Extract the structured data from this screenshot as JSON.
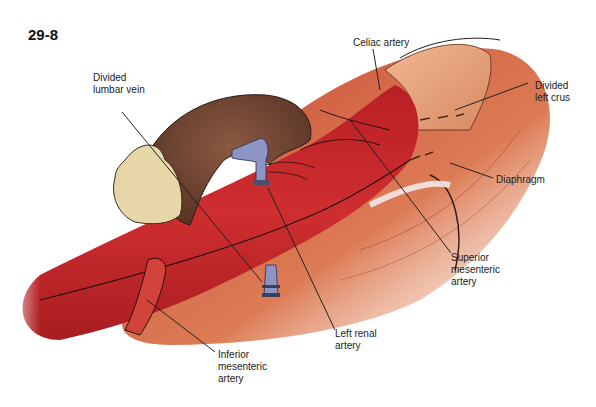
{
  "figure": {
    "number": "29-8"
  },
  "labels": {
    "celiac_artery": "Celiac artery",
    "divided_left_crus": "Divided\nleft crus",
    "divided_lumbar_vein": "Divided\nlumbar vein",
    "diaphragm": "Diaphragm",
    "superior_mesenteric_artery": "Superior\nmesenteric\nartery",
    "left_renal_artery": "Left renal\nartery",
    "inferior_mesenteric_artery": "Inferior\nmesenteric\nartery"
  },
  "colors": {
    "aorta": "#c8262a",
    "aorta_dark": "#9e1c1e",
    "muscle": "#d9784f",
    "crus": "#e8a27a",
    "kidney": "#6e4532",
    "adrenal_fat": "#e6d6a8",
    "vein": "#8d95c4",
    "leader": "#222222"
  }
}
